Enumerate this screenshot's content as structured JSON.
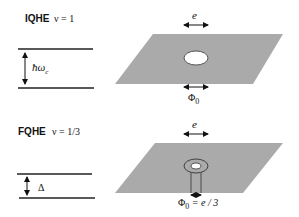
{
  "colors": {
    "plane": "#aaaaaa",
    "hole": "#ffffff",
    "ink": "#111111",
    "background": "#ffffff"
  },
  "iqhe": {
    "title": "IQHE",
    "filling": "ν = 1",
    "gap_label": "ħω",
    "gap_subscript": "c",
    "charge_label": "e",
    "flux_label": "Φ",
    "flux_subscript": "0"
  },
  "fqhe": {
    "title": "FQHE",
    "filling": "ν = 1/3",
    "gap_label": "Δ",
    "charge_label": "e",
    "flux_label": "Φ",
    "flux_subscript": "0",
    "flux_relation": " = e / 3"
  }
}
